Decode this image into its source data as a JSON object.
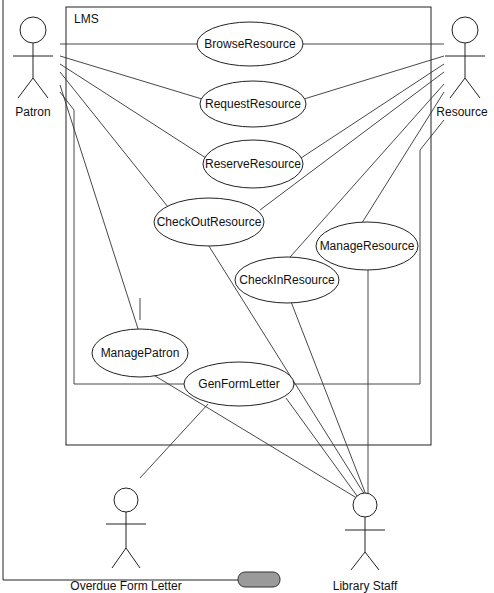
{
  "diagram": {
    "type": "uml-use-case",
    "system_boundary": {
      "label": "LMS"
    },
    "actors": [
      {
        "id": "patron",
        "label": "Patron"
      },
      {
        "id": "resource",
        "label": "Resource"
      },
      {
        "id": "overdue",
        "label": "Overdue Form Letter"
      },
      {
        "id": "staff",
        "label": "Library Staff"
      }
    ],
    "use_cases": [
      {
        "id": "browse",
        "label": "BrowseResource"
      },
      {
        "id": "request",
        "label": "RequestResource"
      },
      {
        "id": "reserve",
        "label": "ReserveResource"
      },
      {
        "id": "checkout",
        "label": "CheckOutResource"
      },
      {
        "id": "manageres",
        "label": "ManageResource"
      },
      {
        "id": "checkin",
        "label": "CheckInResource"
      },
      {
        "id": "managepatron",
        "label": "ManagePatron"
      },
      {
        "id": "genform",
        "label": "GenFormLetter"
      }
    ],
    "associations": [
      [
        "patron",
        "browse"
      ],
      [
        "patron",
        "request"
      ],
      [
        "patron",
        "reserve"
      ],
      [
        "patron",
        "checkout"
      ],
      [
        "patron",
        "managepatron"
      ],
      [
        "patron",
        "genform"
      ],
      [
        "resource",
        "browse"
      ],
      [
        "resource",
        "request"
      ],
      [
        "resource",
        "reserve"
      ],
      [
        "resource",
        "checkout"
      ],
      [
        "resource",
        "checkin"
      ],
      [
        "resource",
        "manageres"
      ],
      [
        "resource",
        "genform"
      ],
      [
        "staff",
        "checkout"
      ],
      [
        "staff",
        "checkin"
      ],
      [
        "staff",
        "manageres"
      ],
      [
        "staff",
        "managepatron"
      ],
      [
        "staff",
        "genform"
      ],
      [
        "overdue",
        "genform"
      ]
    ]
  }
}
